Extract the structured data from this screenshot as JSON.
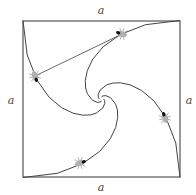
{
  "diagram": {
    "type": "pursuit-curves",
    "labels": {
      "top": "a",
      "bottom": "a",
      "left": "a",
      "right": "a"
    },
    "square": {
      "x": 23,
      "y": 21,
      "width": 157,
      "height": 156
    },
    "bugs": [
      {
        "name": "bug-top-left-curve",
        "x": 35,
        "y": 76
      },
      {
        "name": "bug-top-right-curve",
        "x": 122,
        "y": 34
      },
      {
        "name": "bug-bottom-right-curve",
        "x": 165,
        "y": 118
      },
      {
        "name": "bug-bottom-left-curve",
        "x": 80,
        "y": 163
      }
    ],
    "colors": {
      "line": "#555555",
      "bug_body": "#a0a0a0",
      "bug_head": "#111111"
    }
  }
}
